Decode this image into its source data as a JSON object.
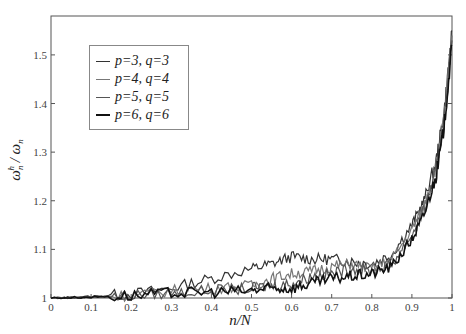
{
  "chart_data": {
    "type": "line",
    "title": "",
    "xlabel": "n/N",
    "ylabel": "ω_n^h / ω_n",
    "xlim": [
      0,
      1
    ],
    "ylim": [
      1,
      1.58
    ],
    "grid": false,
    "legend_position": "upper left",
    "xticks": [
      "0",
      "0.1",
      "0.2",
      "0.3",
      "0.4",
      "0.5",
      "0.6",
      "0.7",
      "0.8",
      "0.9",
      "1"
    ],
    "yticks": [
      "1",
      "1.1",
      "1.2",
      "1.3",
      "1.4",
      "1.5"
    ],
    "x": [
      0,
      0.1,
      0.2,
      0.3,
      0.4,
      0.5,
      0.55,
      0.6,
      0.65,
      0.7,
      0.75,
      0.8,
      0.85,
      0.9,
      0.93,
      0.96,
      0.98,
      1.0
    ],
    "series": [
      {
        "name": "p=3, q=3",
        "color": "#333333",
        "values": [
          1.0,
          1.003,
          1.008,
          1.02,
          1.04,
          1.06,
          1.07,
          1.085,
          1.08,
          1.08,
          1.075,
          1.07,
          1.09,
          1.15,
          1.2,
          1.28,
          1.38,
          1.55
        ]
      },
      {
        "name": "p=4, q=4",
        "color": "#777777",
        "values": [
          1.0,
          1.002,
          1.006,
          1.015,
          1.02,
          1.025,
          1.04,
          1.05,
          1.055,
          1.065,
          1.07,
          1.06,
          1.08,
          1.14,
          1.19,
          1.27,
          1.37,
          1.54
        ]
      },
      {
        "name": "p=5, q=5",
        "color": "#555555",
        "values": [
          1.0,
          1.002,
          1.005,
          1.01,
          1.015,
          1.02,
          1.025,
          1.03,
          1.045,
          1.05,
          1.06,
          1.055,
          1.07,
          1.13,
          1.18,
          1.26,
          1.36,
          1.53
        ]
      },
      {
        "name": "p=6, q=6",
        "color": "#111111",
        "values": [
          1.0,
          1.002,
          1.005,
          1.01,
          1.012,
          1.015,
          1.02,
          1.02,
          1.03,
          1.04,
          1.045,
          1.05,
          1.065,
          1.12,
          1.17,
          1.25,
          1.35,
          1.52
        ]
      }
    ]
  },
  "legend": {
    "items": [
      "p=3, q=3",
      "p=4, q=4",
      "p=5, q=5",
      "p=6, q=6"
    ]
  }
}
